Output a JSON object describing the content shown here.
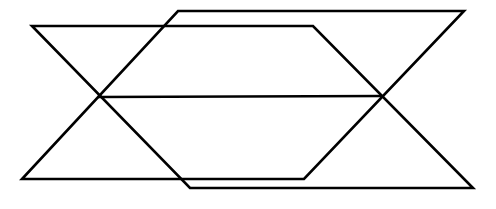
{
  "figure": {
    "title": "Two overlapping parallelograms",
    "background_color": "#ffffff",
    "stroke_color": "#000000",
    "stroke_width": 2.6,
    "canvas": {
      "width": 496,
      "height": 209
    },
    "shapes": [
      {
        "name": "parallelogram-a",
        "label": "Parallelogram A",
        "points": "32,26 313,26 190,188 473,188",
        "ordered_points": "32,26 313,26 473,188 190,188",
        "vertices": [
          {
            "name": "a-top-left",
            "x": 32,
            "y": 26
          },
          {
            "name": "a-top-right",
            "x": 313,
            "y": 26
          },
          {
            "name": "a-bottom-right",
            "x": 473,
            "y": 188
          },
          {
            "name": "a-bottom-left",
            "x": 190,
            "y": 188
          }
        ]
      },
      {
        "name": "parallelogram-b",
        "label": "Parallelogram B",
        "points": "178,11 464,11 304,179 22,179",
        "ordered_points": "178,11 464,11 304,179 22,179",
        "vertices": [
          {
            "name": "b-top-left",
            "x": 178,
            "y": 11
          },
          {
            "name": "b-top-right",
            "x": 464,
            "y": 11
          },
          {
            "name": "b-bottom-right",
            "x": 304,
            "y": 179
          },
          {
            "name": "b-bottom-left",
            "x": 22,
            "y": 179
          }
        ]
      }
    ],
    "connector": {
      "name": "midline",
      "label": "Horizontal line joining the left and right crossing points",
      "x1": 99,
      "y1": 97,
      "x2": 381,
      "y2": 96
    },
    "intersections": [
      {
        "name": "left-crossing",
        "x": 99,
        "y": 97
      },
      {
        "name": "right-crossing",
        "x": 381,
        "y": 96
      }
    ]
  }
}
